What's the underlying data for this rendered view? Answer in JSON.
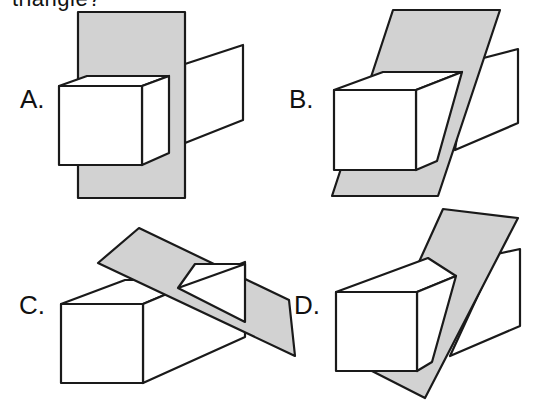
{
  "question": {
    "text_fragment": "triangle?"
  },
  "options": [
    {
      "id": "A",
      "label": "A.",
      "description": "Vertical rectangular plane cutting straight through prism, perpendicular to its length (square cross-section)"
    },
    {
      "id": "B",
      "label": "B.",
      "description": "Slanted parallelogram plane cutting through prism producing a quadrilateral cross-section"
    },
    {
      "id": "C",
      "label": "C.",
      "description": "Tilted plane slicing off a corner of the prism producing a triangular cross-section"
    },
    {
      "id": "D",
      "label": "D.",
      "description": "Steep angled plane cutting prism at an oblique angle producing a pentagon-like cross-section"
    }
  ],
  "colors": {
    "plane_fill": "#d2d2d2",
    "stroke": "#1a1a1a",
    "face_fill": "#ffffff"
  }
}
